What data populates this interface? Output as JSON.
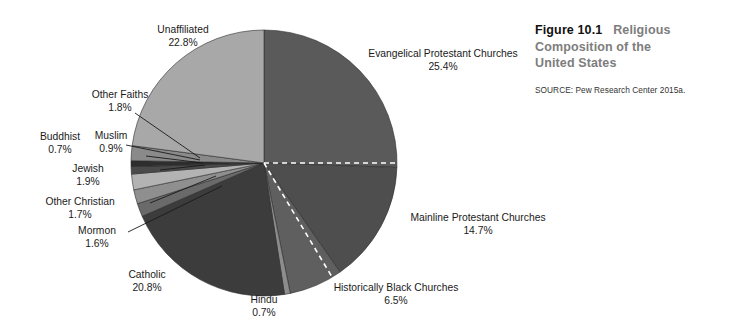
{
  "caption": {
    "figure_number": "Figure 10.1",
    "title_line_1": "Religious",
    "title_line_2": "Composition of the",
    "title_line_3": "United States",
    "source": "SOURCE: Pew Research Center 2015a."
  },
  "chart_data": {
    "type": "pie",
    "title": "Religious Composition of the United States",
    "unit": "percent",
    "start_angle_deg": 0,
    "direction": "clockwise",
    "legend": "none (direct labels with leader lines)",
    "grid": false,
    "categories": [
      "Evangelical Protestant Churches",
      "Mainline Protestant Churches",
      "Historically Black Churches",
      "Hindu",
      "Catholic",
      "Mormon",
      "Other Christian",
      "Jewish",
      "Muslim",
      "Buddhist",
      "Other Faiths",
      "Unaffiliated"
    ],
    "values": [
      25.4,
      14.7,
      6.5,
      0.7,
      20.8,
      1.6,
      1.7,
      1.9,
      0.9,
      0.7,
      1.8,
      22.8
    ],
    "value_labels": [
      "25.4%",
      "14.7%",
      "6.5%",
      "0.7%",
      "20.8%",
      "1.6%",
      "1.7%",
      "1.9%",
      "0.9%",
      "0.7%",
      "1.8%",
      "22.8%"
    ],
    "colors": [
      "#5a5a5a",
      "#4e4e4e",
      "#5f5f5f",
      "#8d8d8d",
      "#3c3c3c",
      "#6a6a6a",
      "#8f8f8f",
      "#b3b3b3",
      "#4a4a4a",
      "#2e2e2e",
      "#8a8a8a",
      "#a8a8a8"
    ]
  },
  "labels": {
    "evangelical": {
      "name": "Evangelical Protestant Churches",
      "pct": "25.4%"
    },
    "mainline": {
      "name": "Mainline Protestant Churches",
      "pct": "14.7%"
    },
    "black": {
      "name": "Historically Black Churches",
      "pct": "6.5%"
    },
    "hindu": {
      "name": "Hindu",
      "pct": "0.7%"
    },
    "catholic": {
      "name": "Catholic",
      "pct": "20.8%"
    },
    "mormon": {
      "name": "Mormon",
      "pct": "1.6%"
    },
    "otherchr": {
      "name": "Other Christian",
      "pct": "1.7%"
    },
    "jewish": {
      "name": "Jewish",
      "pct": "1.9%"
    },
    "muslim": {
      "name": "Muslim",
      "pct": "0.9%"
    },
    "buddhist": {
      "name": "Buddhist",
      "pct": "0.7%"
    },
    "otherfaith": {
      "name": "Other Faiths",
      "pct": "1.8%"
    },
    "unaffiliated": {
      "name": "Unaffiliated",
      "pct": "22.8%"
    }
  }
}
